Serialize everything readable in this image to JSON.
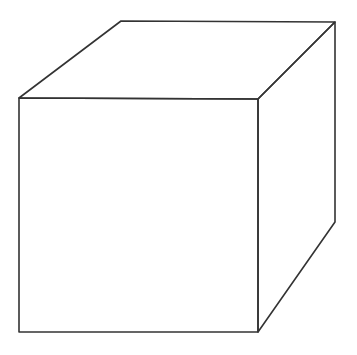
{
  "canvas": {
    "width": 357,
    "height": 355,
    "background": "#ffffff"
  },
  "style": {
    "stroke_color": "#333333",
    "stroke_width": 1.6
  },
  "diagram": {
    "type": "cube-line-drawing",
    "vertices": {
      "front_top_left": [
        19,
        98
      ],
      "front_top_right": [
        258,
        99
      ],
      "front_bottom_right": [
        258,
        332
      ],
      "front_bottom_left": [
        19,
        332
      ],
      "back_top_left": [
        121,
        21
      ],
      "back_top_right": [
        335,
        22
      ],
      "back_bottom_right": [
        335,
        222
      ]
    },
    "faces": [
      {
        "name": "front-face",
        "points": [
          "front_top_left",
          "front_top_right",
          "front_bottom_right",
          "front_bottom_left"
        ]
      },
      {
        "name": "top-face",
        "points": [
          "front_top_left",
          "back_top_left",
          "back_top_right",
          "front_top_right"
        ]
      },
      {
        "name": "right-face",
        "points": [
          "front_top_right",
          "back_top_right",
          "back_bottom_right",
          "front_bottom_right"
        ]
      }
    ]
  }
}
